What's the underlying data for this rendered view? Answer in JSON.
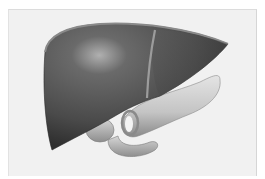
{
  "image": {
    "subject": "anatomical illustration of liver, gallbladder and pancreas",
    "colors": {
      "background": "#ffffff",
      "frame": "#f1f1f1",
      "liver_dark": "#3a3a3a",
      "liver_mid": "#5a5a5a",
      "liver_highlight": "#a8a8a8",
      "pancreas": "#cfcfcf",
      "pancreas_shadow": "#8d8d8d"
    }
  }
}
